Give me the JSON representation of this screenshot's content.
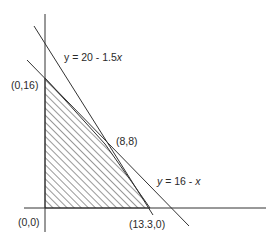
{
  "diagram": {
    "type": "linear-programming-feasible-region",
    "colors": {
      "line": "#333333",
      "hatch": "#333333",
      "background": "#ffffff"
    },
    "lines": [
      {
        "name": "constraint-1",
        "equation_prefix": "y = 20 - 1.5",
        "equation_var": "x"
      },
      {
        "name": "constraint-2",
        "equation_prefix": "y = 16 - ",
        "equation_var": "x"
      }
    ],
    "vertices": [
      {
        "label": "(0,0)"
      },
      {
        "label": "(0,16)"
      },
      {
        "label": "(8,8)"
      },
      {
        "label": "(13.3,0)"
      }
    ],
    "region": {
      "fill": "diagonal-hatch",
      "description": "feasible region"
    }
  }
}
